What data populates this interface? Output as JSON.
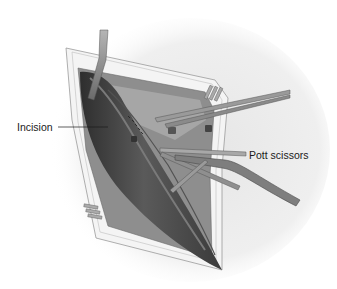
{
  "figure": {
    "labels": [
      {
        "id": "incision",
        "text": "Incision",
        "pointer_from": [
          58,
          127
        ],
        "pointer_to": [
          108,
          127
        ]
      },
      {
        "id": "pott-scissors",
        "text": "Pott scissors",
        "pointer_from": [
          247,
          155
        ],
        "pointer_to": [
          170,
          150
        ]
      }
    ],
    "colors": {
      "background_oval": "#eeeeee",
      "skin_edge": "#f5f5f5",
      "tissue_light": "#9a9a9a",
      "tissue_mid": "#6e6e6e",
      "vessel_dark": "#3a3a3a",
      "instrument": "#8c8c8c",
      "label_text": "#1a1a1a"
    }
  }
}
